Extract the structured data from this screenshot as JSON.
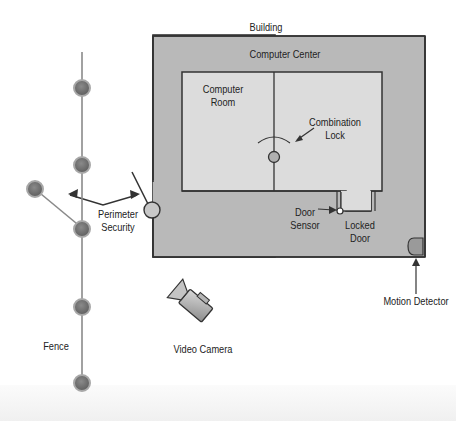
{
  "diagram": {
    "labels": {
      "building": "Building",
      "computer_center": "Computer Center",
      "computer_room_line1": "Computer",
      "computer_room_line2": "Room",
      "combination_lock_line1": "Combination",
      "combination_lock_line2": "Lock",
      "door_sensor_line1": "Door",
      "door_sensor_line2": "Sensor",
      "locked_door_line1": "Locked",
      "locked_door_line2": "Door",
      "perimeter_security_line1": "Perimeter",
      "perimeter_security_line2": "Security",
      "motion_detector": "Motion Detector",
      "fence": "Fence",
      "video_camera": "Video Camera"
    },
    "icons": [
      "fence-post-icon",
      "gate-icon",
      "combination-lock-icon",
      "door-sensor-icon",
      "motion-detector-icon",
      "video-camera-icon"
    ],
    "colors": {
      "building_fill": "#b9b9b9",
      "room_fill": "#dcdcdc",
      "outline": "#333333",
      "post_fill": "#7a7a7a",
      "post_ring": "#a8a8a8",
      "fence_line": "#8a8a8a"
    }
  }
}
